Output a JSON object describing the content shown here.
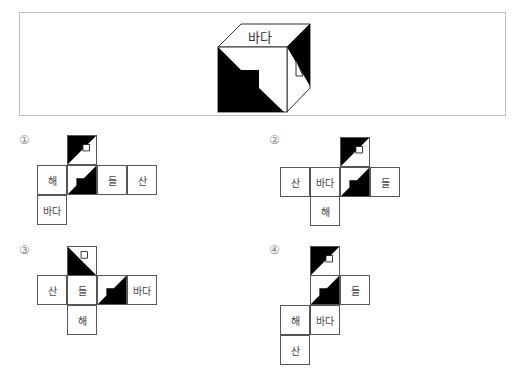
{
  "problem": {
    "cube": {
      "top_face_label": "바다"
    },
    "options": [
      {
        "number": "①",
        "cells": [
          "해",
          "들",
          "산",
          "바다"
        ]
      },
      {
        "number": "②",
        "cells": [
          "산",
          "바다",
          "들",
          "해"
        ]
      },
      {
        "number": "③",
        "cells": [
          "산",
          "들",
          "바다",
          "해"
        ]
      },
      {
        "number": "④",
        "cells": [
          "들",
          "해",
          "바다",
          "산"
        ]
      }
    ]
  },
  "colors": {
    "ink": "#000000",
    "border": "#555555",
    "frame": "#bdbdbd"
  }
}
